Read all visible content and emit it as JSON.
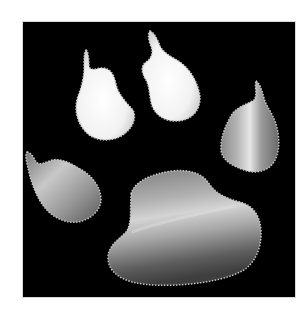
{
  "image": {
    "subject": "animal paw print",
    "background_color": "#000000",
    "page_color": "#ffffff",
    "elements": [
      {
        "name": "toe-left-inner",
        "fill": "bright white"
      },
      {
        "name": "toe-right-inner",
        "fill": "bright white"
      },
      {
        "name": "toe-right-outer",
        "fill": "grey metallic"
      },
      {
        "name": "toe-left-outer",
        "fill": "grey metallic"
      },
      {
        "name": "main-pad",
        "fill": "grey metallic"
      }
    ]
  }
}
